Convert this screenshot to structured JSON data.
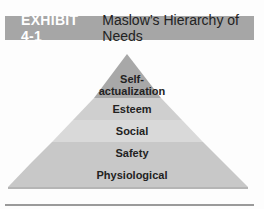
{
  "header": {
    "exhibit": "EXHIBIT 4-1",
    "title": "Maslow’s Hierarchy of Needs"
  },
  "pyramid": {
    "levels": [
      {
        "label": "Self-\nactualization",
        "line1": "Self-",
        "line2": "actualization",
        "color": "#a8a8a8"
      },
      {
        "label": "Esteem",
        "color": "#cfcfcf"
      },
      {
        "label": "Social",
        "color": "#d9d9d9"
      },
      {
        "label": "Safety",
        "color": "#c8c8c8"
      },
      {
        "label": "Physiological",
        "color": "#c8c8c8"
      }
    ]
  }
}
